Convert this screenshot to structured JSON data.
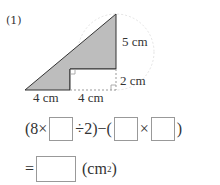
{
  "problem": {
    "label": "(1)",
    "dims": {
      "right_upper": "5 cm",
      "right_lower": "2 cm",
      "bottom_left": "4 cm",
      "bottom_right": "4 cm"
    },
    "colors": {
      "shaded": "#bdbdbd",
      "line": "#333333"
    },
    "equation": {
      "line1": {
        "open": "(8×",
        "mid": "÷2)−(",
        "times": "×",
        "close": ")"
      },
      "line2": {
        "eq": "=",
        "unit": "(cm",
        "sup": "2",
        "unit_close": ")"
      }
    }
  }
}
